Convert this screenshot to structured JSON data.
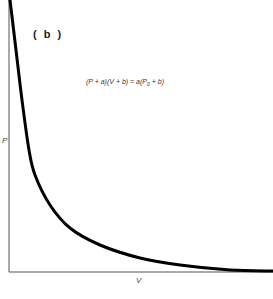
{
  "chart_data": {
    "type": "line",
    "title": "",
    "panel_label": "( b )",
    "equation": {
      "lhs": "(P + a)(V + b) = a(P",
      "subscript": "0",
      "rhs": " + b)"
    },
    "xlabel": "V",
    "ylabel": "P",
    "grid": false,
    "legend": null,
    "x_ticks": [],
    "y_ticks": [],
    "series": [
      {
        "name": "P vs V (hyperbolic decay)",
        "color": "#000000",
        "pixel_points": [
          [
            10,
            0
          ],
          [
            16,
            50
          ],
          [
            22,
            100
          ],
          [
            29,
            150
          ],
          [
            35,
            175
          ],
          [
            50,
            205
          ],
          [
            70,
            228
          ],
          [
            100,
            245
          ],
          [
            140,
            258
          ],
          [
            180,
            265
          ],
          [
            230,
            270
          ],
          [
            273,
            271
          ]
        ]
      }
    ],
    "axis_color": "#555555",
    "caption": "Fig. 4.?"
  }
}
